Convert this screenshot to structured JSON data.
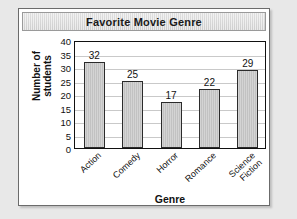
{
  "chart_data": {
    "type": "bar",
    "title": "Favorite Movie Genre",
    "xlabel": "Genre",
    "ylabel": "Number of\nstudents",
    "categories": [
      "Action",
      "Comedy",
      "Horror",
      "Romance",
      "Science\nFiction"
    ],
    "values": [
      32,
      25,
      17,
      22,
      29
    ],
    "value_labels": [
      "32",
      "25",
      "17",
      "22",
      "29"
    ],
    "ylim": [
      0,
      40
    ],
    "ytick_values": [
      0,
      5,
      10,
      15,
      20,
      25,
      30,
      35,
      40
    ],
    "ytick_labels": [
      "0",
      "5",
      "10",
      "15",
      "20",
      "25",
      "30",
      "35",
      "40"
    ],
    "grid": "horizontal",
    "legend": "none",
    "colors": {
      "bar_fill": "#cccccc",
      "bar_edge": "#2b2b2b",
      "gridline": "#c9c9c9",
      "axis": "#111111",
      "title_bar": "#dcdcdc",
      "card_background": "#ffffff",
      "page_background": "#e8e8e8"
    }
  }
}
